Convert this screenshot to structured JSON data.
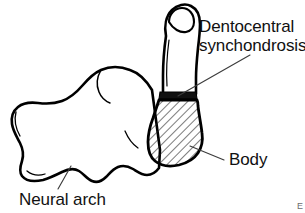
{
  "figure": {
    "kind": "anatomical-line-drawing",
    "width": 305,
    "height": 213,
    "background_color": "#ffffff",
    "ink_color": "#000000",
    "leader_line_color": "#3c3c3c"
  },
  "labels": {
    "dentocentral": {
      "line1": "Dentocentral",
      "line2": "synchondrosis"
    },
    "body": "Body",
    "neural_arch": "Neural arch"
  },
  "corner": {
    "mark": "E"
  },
  "structures": {
    "dens": {
      "name": "dens",
      "fill": "#ffffff",
      "stroke": "#000000"
    },
    "synchondrosis_band": {
      "name": "dentocentral synchondrosis",
      "fill": "#111111"
    },
    "body": {
      "name": "body",
      "fill": "hatched",
      "hatch_angle_degrees": 45,
      "hatch_color": "#1a1a1a"
    },
    "neural_arch": {
      "name": "neural arch",
      "fill": "#ffffff",
      "stroke": "#000000"
    }
  }
}
